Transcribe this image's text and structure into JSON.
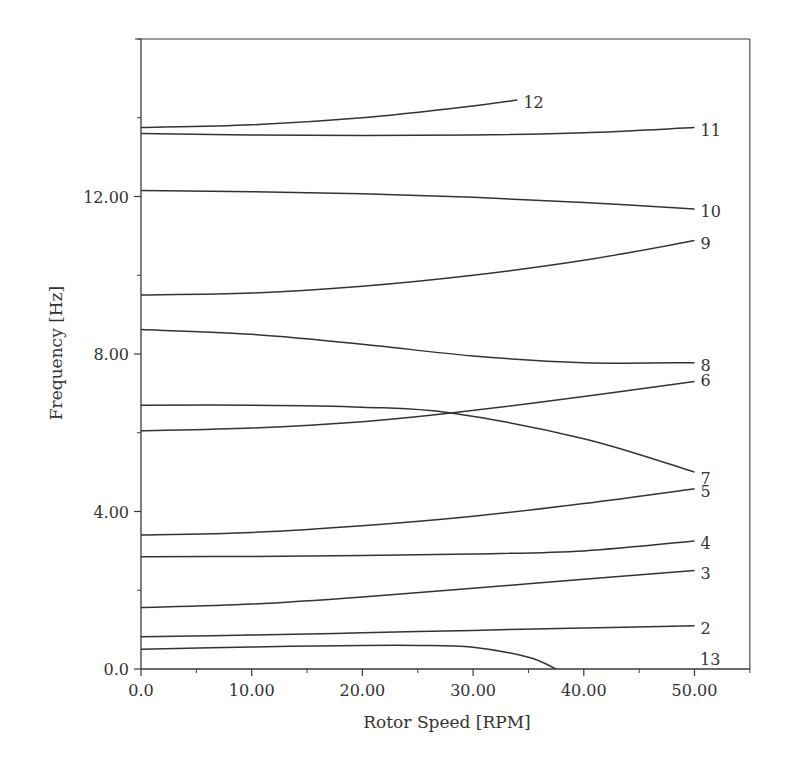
{
  "chart_data": {
    "type": "line",
    "title": "",
    "xlabel": "Rotor Speed [RPM]",
    "ylabel": "Frequency [Hz]",
    "xlim": [
      0,
      55
    ],
    "ylim": [
      0,
      16
    ],
    "grid": false,
    "legend": "none (curves labeled inline at right end)",
    "x_ticks": [
      {
        "v": 0,
        "label": "0.0"
      },
      {
        "v": 10,
        "label": "10.00"
      },
      {
        "v": 20,
        "label": "20.00"
      },
      {
        "v": 30,
        "label": "30.00"
      },
      {
        "v": 40,
        "label": "40.00"
      },
      {
        "v": 50,
        "label": "50.00"
      }
    ],
    "x_minor_ticks": [
      5,
      15,
      25,
      35,
      45,
      55
    ],
    "y_ticks": [
      {
        "v": 0,
        "label": "0.0"
      },
      {
        "v": 4,
        "label": "4.00"
      },
      {
        "v": 8,
        "label": "8.00"
      },
      {
        "v": 12,
        "label": "12.00"
      }
    ],
    "y_minor_ticks": [
      2,
      6,
      10,
      14,
      16
    ],
    "series": [
      {
        "name": "2",
        "label": "2",
        "x": [
          0,
          10,
          20,
          30,
          40,
          50
        ],
        "y": [
          0.82,
          0.86,
          0.92,
          0.98,
          1.04,
          1.1
        ]
      },
      {
        "name": "3",
        "label": "3",
        "x": [
          0,
          10,
          20,
          30,
          40,
          50
        ],
        "y": [
          1.56,
          1.65,
          1.83,
          2.05,
          2.28,
          2.5
        ]
      },
      {
        "name": "4",
        "label": "4",
        "x": [
          0,
          10,
          20,
          30,
          40,
          50
        ],
        "y": [
          2.85,
          2.86,
          2.88,
          2.92,
          3.0,
          3.25
        ]
      },
      {
        "name": "5",
        "label": "5",
        "x": [
          0,
          10,
          20,
          30,
          40,
          50
        ],
        "y": [
          3.4,
          3.47,
          3.64,
          3.88,
          4.2,
          4.58
        ]
      },
      {
        "name": "6",
        "label": "6",
        "x": [
          0,
          10,
          20,
          28,
          40,
          50
        ],
        "y": [
          6.05,
          6.12,
          6.28,
          6.5,
          6.92,
          7.3
        ]
      },
      {
        "name": "7",
        "label": "7",
        "x": [
          0,
          10,
          20,
          28,
          40,
          50
        ],
        "y": [
          6.7,
          6.7,
          6.65,
          6.5,
          5.85,
          5.0
        ]
      },
      {
        "name": "8",
        "label": "8",
        "x": [
          0,
          10,
          20,
          30,
          40,
          50
        ],
        "y": [
          8.62,
          8.5,
          8.25,
          7.95,
          7.78,
          7.78
        ]
      },
      {
        "name": "9",
        "label": "9",
        "x": [
          0,
          10,
          20,
          30,
          40,
          50
        ],
        "y": [
          9.5,
          9.55,
          9.72,
          10.0,
          10.38,
          10.88
        ]
      },
      {
        "name": "10",
        "label": "10",
        "x": [
          0,
          10,
          20,
          30,
          40,
          50
        ],
        "y": [
          12.15,
          12.12,
          12.07,
          11.98,
          11.85,
          11.68
        ]
      },
      {
        "name": "11",
        "label": "11",
        "x": [
          0,
          10,
          20,
          30,
          40,
          50
        ],
        "y": [
          13.6,
          13.56,
          13.55,
          13.56,
          13.62,
          13.75
        ]
      },
      {
        "name": "12",
        "label": "12",
        "x": [
          0,
          10,
          20,
          30,
          34
        ],
        "y": [
          13.75,
          13.82,
          14.0,
          14.3,
          14.45
        ]
      },
      {
        "name": "13",
        "label": "13",
        "x": [
          0,
          10,
          20,
          25,
          30,
          35,
          37.5
        ],
        "y": [
          0.5,
          0.56,
          0.6,
          0.6,
          0.55,
          0.3,
          0
        ]
      }
    ]
  }
}
